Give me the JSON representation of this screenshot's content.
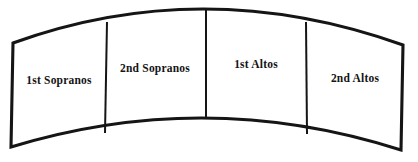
{
  "diagram": {
    "type": "choir-seating-arc",
    "background_color": "#ffffff",
    "outline_color": "#151515",
    "text_color": "#141414",
    "fill_color": "#ffffff",
    "outline_stroke_width": 3.1,
    "divider_stroke_width": 2.0,
    "geometry": {
      "top_left": [
        13,
        43
      ],
      "top_right": [
        403,
        45
      ],
      "bottom_right": [
        401,
        150
      ],
      "bottom_left": [
        11,
        147
      ],
      "top_arc_apex": [
        206,
        9
      ],
      "bottom_arc_apex": [
        206,
        118
      ],
      "top_arc_path": "M 13 43 Q 206 -10 403 45",
      "bottom_arc_path": "M 11 147 Q 206 88 401 150"
    },
    "sections": [
      {
        "label": "1st Sopranos",
        "label_x": 59,
        "label_y": 84,
        "divider_after": {
          "x1": 107,
          "y1": 22,
          "x2": 105,
          "y2": 133
        }
      },
      {
        "label": "2nd Sopranos",
        "label_x": 155,
        "label_y": 72,
        "divider_after": {
          "x1": 206,
          "y1": 9,
          "x2": 206,
          "y2": 119
        }
      },
      {
        "label": "1st Altos",
        "label_x": 256,
        "label_y": 68,
        "divider_after": {
          "x1": 306,
          "y1": 22,
          "x2": 307,
          "y2": 134
        }
      },
      {
        "label": "2nd Altos",
        "label_x": 355,
        "label_y": 82,
        "divider_after": null
      }
    ]
  }
}
